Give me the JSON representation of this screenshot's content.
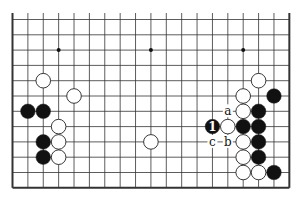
{
  "diagram": {
    "type": "go-board-diagram",
    "board_size": 19,
    "visible_columns": 19,
    "visible_rows": 12,
    "view": "bottom 12 rows of a 19x19 board; top edge open",
    "colors": {
      "background": "#ffffff",
      "line": "#333333",
      "black_stone": "#111111",
      "white_stone": "#ffffff"
    },
    "star_points": [
      {
        "col": 3,
        "row": 2
      },
      {
        "col": 9,
        "row": 2
      },
      {
        "col": 15,
        "row": 2
      }
    ],
    "stones": [
      {
        "color": "white",
        "col": 2,
        "row": 4
      },
      {
        "color": "white",
        "col": 4,
        "row": 5
      },
      {
        "color": "black",
        "col": 1,
        "row": 6
      },
      {
        "color": "black",
        "col": 2,
        "row": 6
      },
      {
        "color": "white",
        "col": 3,
        "row": 7
      },
      {
        "color": "black",
        "col": 2,
        "row": 8
      },
      {
        "color": "white",
        "col": 3,
        "row": 8
      },
      {
        "color": "black",
        "col": 2,
        "row": 9
      },
      {
        "color": "white",
        "col": 3,
        "row": 9
      },
      {
        "color": "white",
        "col": 9,
        "row": 8
      },
      {
        "color": "white",
        "col": 16,
        "row": 4
      },
      {
        "color": "white",
        "col": 15,
        "row": 5
      },
      {
        "color": "black",
        "col": 17,
        "row": 5
      },
      {
        "color": "white",
        "col": 15,
        "row": 6
      },
      {
        "color": "black",
        "col": 16,
        "row": 6
      },
      {
        "color": "black",
        "col": 13,
        "row": 7,
        "label": "1"
      },
      {
        "color": "white",
        "col": 14,
        "row": 7
      },
      {
        "color": "black",
        "col": 15,
        "row": 7
      },
      {
        "color": "black",
        "col": 16,
        "row": 7
      },
      {
        "color": "white",
        "col": 15,
        "row": 8
      },
      {
        "color": "black",
        "col": 16,
        "row": 8
      },
      {
        "color": "white",
        "col": 15,
        "row": 9
      },
      {
        "color": "black",
        "col": 16,
        "row": 9
      },
      {
        "color": "white",
        "col": 15,
        "row": 10
      },
      {
        "color": "white",
        "col": 16,
        "row": 10
      },
      {
        "color": "black",
        "col": 17,
        "row": 10
      }
    ],
    "letter_marks": [
      {
        "label": "a",
        "col": 14,
        "row": 6
      },
      {
        "label": "b",
        "col": 14,
        "row": 8
      },
      {
        "label": "c",
        "col": 13,
        "row": 8
      }
    ]
  }
}
